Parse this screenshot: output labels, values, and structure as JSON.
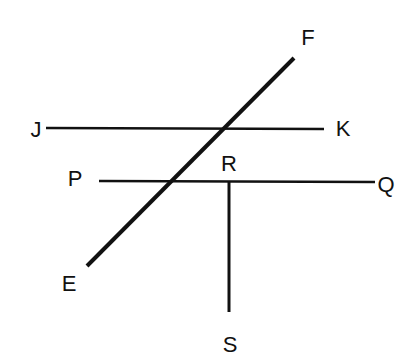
{
  "diagram": {
    "title": "",
    "colors": {
      "stroke": "#111111",
      "background": "#ffffff"
    },
    "segments": [
      {
        "id": "EF",
        "from": "E",
        "to": "F",
        "x1": 87,
        "y1": 266,
        "x2": 294,
        "y2": 58,
        "width": 4
      },
      {
        "id": "JK",
        "from": "J",
        "to": "K",
        "x1": 46,
        "y1": 128,
        "x2": 324,
        "y2": 129,
        "width": 2.5
      },
      {
        "id": "PQ",
        "from": "P",
        "to": "Q",
        "x1": 99,
        "y1": 181,
        "x2": 375,
        "y2": 182,
        "width": 2.5
      },
      {
        "id": "RS",
        "from": "R",
        "to": "S",
        "x1": 229,
        "y1": 182,
        "x2": 229,
        "y2": 312,
        "width": 3
      }
    ],
    "labels": [
      {
        "id": "F",
        "text": "F",
        "x": 308,
        "y": 45
      },
      {
        "id": "J",
        "text": "J",
        "x": 36,
        "y": 137
      },
      {
        "id": "K",
        "text": "K",
        "x": 343,
        "y": 136
      },
      {
        "id": "P",
        "text": "P",
        "x": 75,
        "y": 186
      },
      {
        "id": "R",
        "text": "R",
        "x": 229,
        "y": 171
      },
      {
        "id": "Q",
        "text": "Q",
        "x": 386,
        "y": 192
      },
      {
        "id": "E",
        "text": "E",
        "x": 69,
        "y": 291
      },
      {
        "id": "S",
        "text": "S",
        "x": 230,
        "y": 352
      }
    ]
  }
}
